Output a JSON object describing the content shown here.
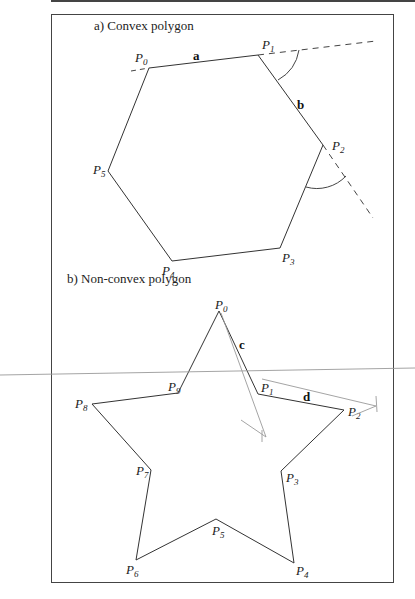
{
  "figure": {
    "panel_a": {
      "title": "a) Convex polygon",
      "vertices": [
        {
          "label": "P",
          "sub": "0",
          "x": 149,
          "y": 68,
          "lx": 135,
          "ly": 62
        },
        {
          "label": "P",
          "sub": "1",
          "x": 258,
          "y": 55,
          "lx": 262,
          "ly": 49
        },
        {
          "label": "P",
          "sub": "2",
          "x": 323,
          "y": 145,
          "lx": 332,
          "ly": 150
        },
        {
          "label": "P",
          "sub": "3",
          "x": 280,
          "y": 248,
          "lx": 282,
          "ly": 262
        },
        {
          "label": "P",
          "sub": "4",
          "x": 172,
          "y": 261,
          "lx": 162,
          "ly": 275
        },
        {
          "label": "P",
          "sub": "5",
          "x": 108,
          "y": 171,
          "lx": 93,
          "ly": 174
        }
      ],
      "edge_labels": [
        {
          "text": "a",
          "x": 193,
          "y": 60
        },
        {
          "text": "b",
          "x": 297,
          "y": 109
        }
      ]
    },
    "panel_b": {
      "title": "b) Non-convex polygon",
      "vertices": [
        {
          "label": "P",
          "sub": "0",
          "x": 219,
          "y": 311,
          "lx": 215,
          "ly": 309
        },
        {
          "label": "P",
          "sub": "1",
          "x": 258,
          "y": 394,
          "lx": 261,
          "ly": 392
        },
        {
          "label": "P",
          "sub": "2",
          "x": 344,
          "y": 410,
          "lx": 348,
          "ly": 416
        },
        {
          "label": "P",
          "sub": "3",
          "x": 281,
          "y": 471,
          "lx": 286,
          "ly": 482
        },
        {
          "label": "P",
          "sub": "4",
          "x": 294,
          "y": 563,
          "lx": 296,
          "ly": 575
        },
        {
          "label": "P",
          "sub": "5",
          "x": 216,
          "y": 519,
          "lx": 212,
          "ly": 535
        },
        {
          "label": "P",
          "sub": "6",
          "x": 136,
          "y": 560,
          "lx": 126,
          "ly": 574
        },
        {
          "label": "P",
          "sub": "7",
          "x": 151,
          "y": 470,
          "lx": 136,
          "ly": 475
        },
        {
          "label": "P",
          "sub": "8",
          "x": 92,
          "y": 404,
          "lx": 75,
          "ly": 408
        },
        {
          "label": "P",
          "sub": "9",
          "x": 178,
          "y": 393,
          "lx": 168,
          "ly": 391
        }
      ],
      "edge_labels": [
        {
          "text": "c",
          "x": 239,
          "y": 349
        },
        {
          "text": "d",
          "x": 303,
          "y": 401
        }
      ]
    },
    "colors": {
      "line": "#333333",
      "annotation": "#9a9a9a"
    }
  }
}
